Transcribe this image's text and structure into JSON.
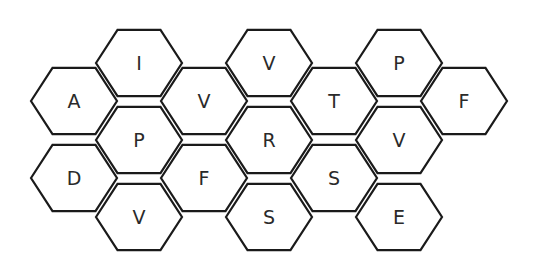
{
  "board": {
    "stroke_color": "#1a1a1a",
    "fill_color": "#ffffff",
    "text_color": "#2a2a2a",
    "hex_radius": 43,
    "cells": [
      {
        "id": "c0-0",
        "letter": "A",
        "cx": 74,
        "cy": 101
      },
      {
        "id": "c0-1",
        "letter": "D",
        "cx": 74,
        "cy": 178
      },
      {
        "id": "c1-0",
        "letter": "I",
        "cx": 139,
        "cy": 63
      },
      {
        "id": "c1-1",
        "letter": "P",
        "cx": 139,
        "cy": 140
      },
      {
        "id": "c1-2",
        "letter": "V",
        "cx": 139,
        "cy": 217
      },
      {
        "id": "c2-0",
        "letter": "V",
        "cx": 204,
        "cy": 101
      },
      {
        "id": "c2-1",
        "letter": "F",
        "cx": 204,
        "cy": 178
      },
      {
        "id": "c3-0",
        "letter": "V",
        "cx": 269,
        "cy": 63
      },
      {
        "id": "c3-1",
        "letter": "R",
        "cx": 269,
        "cy": 140
      },
      {
        "id": "c3-2",
        "letter": "S",
        "cx": 269,
        "cy": 217
      },
      {
        "id": "c4-0",
        "letter": "T",
        "cx": 334,
        "cy": 101
      },
      {
        "id": "c4-1",
        "letter": "S",
        "cx": 334,
        "cy": 178
      },
      {
        "id": "c5-0",
        "letter": "P",
        "cx": 399,
        "cy": 63
      },
      {
        "id": "c5-1",
        "letter": "V",
        "cx": 399,
        "cy": 140
      },
      {
        "id": "c5-2",
        "letter": "E",
        "cx": 399,
        "cy": 217
      },
      {
        "id": "c6-0",
        "letter": "F",
        "cx": 464,
        "cy": 101
      }
    ]
  }
}
